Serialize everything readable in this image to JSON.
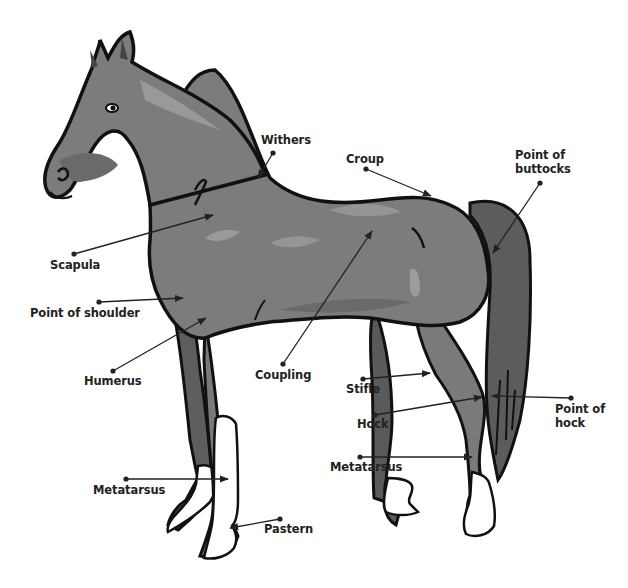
{
  "diagram": {
    "colors": {
      "body": "#7a7a7a",
      "body_dark": "#5a5a5a",
      "body_light": "#9a9a9a",
      "outline": "#111111",
      "white_markings": "#ffffff",
      "hoof_shadow": "#d8d8d8",
      "label_text": "#222222",
      "leader": "#222222"
    },
    "labels": [
      {
        "id": "withers",
        "text": "Withers",
        "x": 261,
        "y": 133,
        "dot": [
          273,
          153
        ],
        "tip": [
          258,
          178
        ]
      },
      {
        "id": "croup",
        "text": "Croup",
        "x": 346,
        "y": 152,
        "dot": [
          366,
          169
        ],
        "tip": [
          431,
          196
        ]
      },
      {
        "id": "point-of-buttocks",
        "text": "Point of\nbuttocks",
        "x": 515,
        "y": 148,
        "dot": [
          540,
          183
        ],
        "tip": [
          493,
          253
        ]
      },
      {
        "id": "scapula",
        "text": "Scapula",
        "x": 50,
        "y": 258,
        "dot": [
          74,
          254
        ],
        "tip": [
          213,
          215
        ]
      },
      {
        "id": "point-of-shoulder",
        "text": "Point of shoulder",
        "x": 30,
        "y": 306,
        "dot": [
          99,
          302
        ],
        "tip": [
          183,
          298
        ]
      },
      {
        "id": "humerus",
        "text": "Humerus",
        "x": 84,
        "y": 374,
        "dot": [
          113,
          371
        ],
        "tip": [
          206,
          318
        ]
      },
      {
        "id": "coupling",
        "text": "Coupling",
        "x": 255,
        "y": 368,
        "dot": [
          283,
          364
        ],
        "tip": [
          372,
          231
        ]
      },
      {
        "id": "stifle",
        "text": "Stifle",
        "x": 346,
        "y": 382,
        "dot": [
          363,
          379
        ],
        "tip": [
          430,
          373
        ]
      },
      {
        "id": "hock",
        "text": "Hock",
        "x": 357,
        "y": 417,
        "dot": [
          375,
          415
        ],
        "tip": [
          482,
          397
        ]
      },
      {
        "id": "point-of-hock",
        "text": "Point of\nhock",
        "x": 555,
        "y": 402,
        "dot": [
          571,
          398
        ],
        "tip": [
          492,
          396
        ]
      },
      {
        "id": "metatarsus-hind",
        "text": "Metatarsus",
        "x": 330,
        "y": 460,
        "dot": [
          360,
          457
        ],
        "tip": [
          472,
          457
        ]
      },
      {
        "id": "metatarsus-fore",
        "text": "Metatarsus",
        "x": 93,
        "y": 483,
        "dot": [
          126,
          479
        ],
        "tip": [
          228,
          479
        ]
      },
      {
        "id": "pastern",
        "text": "Pastern",
        "x": 264,
        "y": 522,
        "dot": [
          280,
          519
        ],
        "tip": [
          230,
          528
        ]
      }
    ]
  }
}
